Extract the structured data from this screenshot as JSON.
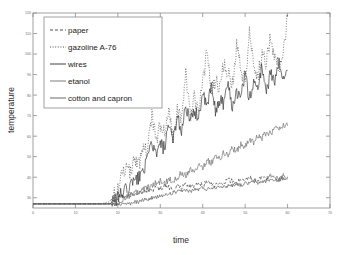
{
  "chart_data": {
    "type": "line",
    "title": "",
    "xlabel": "time",
    "ylabel": "temperature",
    "xlim": [
      0,
      70
    ],
    "ylim": [
      25,
      120
    ],
    "xticks": [
      0,
      10,
      20,
      30,
      40,
      50,
      60,
      70
    ],
    "yticks": [
      30,
      40,
      50,
      60,
      70,
      80,
      90,
      100,
      110,
      120
    ],
    "grid": false,
    "legend_position": "upper-left",
    "series": [
      {
        "name": "paper",
        "style": "dashed",
        "color": "#3a3a3a",
        "x": [
          0,
          2,
          4,
          6,
          8,
          10,
          12,
          14,
          16,
          18,
          19,
          20,
          21,
          22,
          23,
          24,
          25,
          26,
          27,
          28,
          29,
          30,
          31,
          32,
          33,
          34,
          35,
          36,
          37,
          38,
          39,
          40,
          41,
          42,
          43,
          44,
          45,
          46,
          47,
          48,
          49,
          50,
          51,
          52,
          53,
          54,
          55,
          56,
          57,
          58,
          59,
          60
        ],
        "y": [
          27,
          27,
          27,
          27,
          27,
          27,
          27,
          27,
          27,
          27,
          28,
          30,
          31,
          30,
          32,
          31,
          33,
          32,
          34,
          33,
          35,
          34,
          36,
          35,
          34,
          36,
          35,
          37,
          36,
          35,
          37,
          36,
          38,
          37,
          36,
          38,
          37,
          39,
          38,
          37,
          39,
          38,
          40,
          39,
          38,
          40,
          39,
          41,
          40,
          39,
          41,
          40
        ]
      },
      {
        "name": "gazoline A-76",
        "style": "dotted",
        "color": "#3a3a3a",
        "x": [
          0,
          2,
          4,
          6,
          8,
          10,
          12,
          14,
          16,
          18,
          19,
          20,
          21,
          22,
          23,
          24,
          25,
          26,
          27,
          28,
          29,
          30,
          31,
          32,
          33,
          34,
          35,
          36,
          37,
          38,
          39,
          40,
          41,
          42,
          43,
          44,
          45,
          46,
          47,
          48,
          49,
          50,
          51,
          52,
          53,
          54,
          55,
          56,
          57,
          58,
          59,
          60
        ],
        "y": [
          27,
          27,
          27,
          27,
          27,
          27,
          27,
          27,
          27,
          28,
          31,
          35,
          40,
          44,
          42,
          49,
          46,
          55,
          52,
          71,
          58,
          66,
          62,
          74,
          60,
          72,
          68,
          93,
          70,
          78,
          75,
          86,
          100,
          82,
          88,
          84,
          97,
          90,
          86,
          104,
          92,
          88,
          110,
          95,
          90,
          100,
          96,
          108,
          98,
          94,
          102,
          118
        ]
      },
      {
        "name": "wires",
        "style": "solid",
        "color": "#2e2e2e",
        "x": [
          0,
          2,
          4,
          6,
          8,
          10,
          12,
          14,
          16,
          18,
          19,
          20,
          21,
          22,
          23,
          24,
          25,
          26,
          27,
          28,
          29,
          30,
          31,
          32,
          33,
          34,
          35,
          36,
          37,
          38,
          39,
          40,
          41,
          42,
          43,
          44,
          45,
          46,
          47,
          48,
          49,
          50,
          51,
          52,
          53,
          54,
          55,
          56,
          57,
          58,
          59,
          60
        ],
        "y": [
          27,
          27,
          27,
          27,
          27,
          27,
          27,
          27,
          27,
          27,
          28,
          30,
          32,
          34,
          36,
          38,
          40,
          44,
          48,
          58,
          50,
          56,
          54,
          64,
          58,
          70,
          62,
          76,
          66,
          72,
          70,
          80,
          74,
          84,
          72,
          78,
          76,
          86,
          74,
          82,
          80,
          90,
          78,
          86,
          84,
          94,
          82,
          90,
          88,
          96,
          86,
          92
        ]
      },
      {
        "name": "etanol",
        "style": "solid",
        "color": "#6e6e6e",
        "x": [
          0,
          2,
          4,
          6,
          8,
          10,
          12,
          14,
          16,
          18,
          19,
          20,
          21,
          22,
          23,
          24,
          25,
          26,
          27,
          28,
          29,
          30,
          31,
          32,
          33,
          34,
          35,
          36,
          37,
          38,
          39,
          40,
          41,
          42,
          43,
          44,
          45,
          46,
          47,
          48,
          49,
          50,
          51,
          52,
          53,
          54,
          55,
          56,
          57,
          58,
          59,
          60
        ],
        "y": [
          27,
          27,
          27,
          27,
          27,
          27,
          27,
          27,
          27,
          27,
          27,
          28,
          29,
          30,
          31,
          32,
          33,
          34,
          35,
          36,
          37,
          38,
          37,
          39,
          38,
          40,
          42,
          41,
          44,
          43,
          46,
          45,
          48,
          47,
          50,
          49,
          52,
          51,
          54,
          53,
          56,
          55,
          58,
          57,
          60,
          59,
          62,
          61,
          64,
          63,
          66,
          65
        ]
      },
      {
        "name": "cotton and capron",
        "style": "solid",
        "color": "#5a5a5a",
        "x": [
          0,
          2,
          4,
          6,
          8,
          10,
          12,
          14,
          16,
          18,
          19,
          20,
          21,
          22,
          23,
          24,
          25,
          26,
          27,
          28,
          29,
          30,
          31,
          32,
          33,
          34,
          35,
          36,
          37,
          38,
          39,
          40,
          41,
          42,
          43,
          44,
          45,
          46,
          47,
          48,
          49,
          50,
          51,
          52,
          53,
          54,
          55,
          56,
          57,
          58,
          59,
          60
        ],
        "y": [
          27,
          27,
          27,
          27,
          27,
          27,
          27,
          27,
          27,
          27,
          27,
          27,
          27,
          27,
          27,
          28,
          28,
          29,
          29,
          30,
          30,
          31,
          31,
          32,
          32,
          33,
          33,
          34,
          33,
          34,
          34,
          35,
          34,
          35,
          35,
          36,
          35,
          36,
          36,
          37,
          36,
          37,
          37,
          38,
          37,
          38,
          38,
          39,
          38,
          39,
          39,
          40
        ]
      }
    ]
  },
  "legend": {
    "items": [
      {
        "label": "paper"
      },
      {
        "label": "gazoline A-76"
      },
      {
        "label": "wires"
      },
      {
        "label": "etanol"
      },
      {
        "label": "cotton and capron"
      }
    ]
  },
  "axes": {
    "x_title": "time",
    "y_title": "temperature",
    "x_tick_labels": [
      "0",
      "10",
      "20",
      "30",
      "40",
      "50",
      "60",
      "70"
    ],
    "y_tick_labels": [
      "30",
      "40",
      "50",
      "60",
      "70",
      "80",
      "90",
      "100",
      "110",
      "120"
    ]
  }
}
